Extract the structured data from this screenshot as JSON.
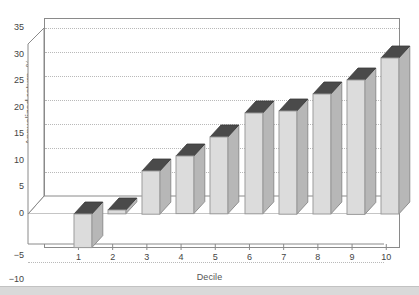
{
  "chart_data": {
    "type": "bar",
    "title": "",
    "subtitle": "",
    "xlabel": "Decile",
    "ylabel": "Annualized return, %",
    "categories": [
      "1",
      "2",
      "3",
      "4",
      "5",
      "6",
      "7",
      "8",
      "9",
      "10"
    ],
    "values": [
      -7.0,
      0.8,
      9.0,
      12.0,
      16.0,
      21.0,
      21.5,
      25.0,
      28.0,
      32.5
    ],
    "series": [
      {
        "name": "Annualized return",
        "values": [
          -7.0,
          0.8,
          9.0,
          12.0,
          16.0,
          21.0,
          21.5,
          25.0,
          28.0,
          32.5
        ]
      }
    ],
    "ylim": [
      -10,
      35
    ],
    "ytick_labels": [
      "35",
      "30",
      "25",
      "20",
      "15",
      "10",
      "5",
      "0",
      "−5",
      "−10"
    ],
    "ytick_values": [
      35,
      30,
      25,
      20,
      15,
      10,
      5,
      0,
      -5,
      -10
    ],
    "ystep": 5,
    "grid": true,
    "grid_axis": "y",
    "legend": null,
    "legend_position": "none",
    "projection": "3d",
    "colors": {
      "bar_front": "#dcdcdc",
      "bar_side": "#b7b7b7",
      "bar_top": "#4a4a4a",
      "grid": "#b9b9b9",
      "axis": "#8a8a8a",
      "text": "#444444",
      "background": "#ffffff",
      "page_strip": "#d9d9d9"
    }
  }
}
